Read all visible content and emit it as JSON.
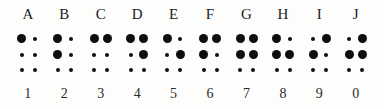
{
  "chart_data": {
    "type": "table",
    "xlabel": "",
    "ylabel": "",
    "legend": [],
    "grid": false,
    "cell_rows": 3,
    "cell_columns": 2,
    "dot_states": [
      "raised",
      "flat"
    ],
    "colors": {
      "background": "#fdfdfc",
      "dot": "#0d0d0d",
      "text": "#1b1b1b"
    },
    "columns": [
      {
        "letter": "A",
        "number": "1",
        "raised_dots": [
          1
        ],
        "pattern": [
          [
            "raised",
            "flat"
          ],
          [
            "flat",
            "flat"
          ],
          [
            "flat",
            "flat"
          ]
        ]
      },
      {
        "letter": "B",
        "number": "2",
        "raised_dots": [
          1,
          2
        ],
        "pattern": [
          [
            "raised",
            "flat"
          ],
          [
            "raised",
            "flat"
          ],
          [
            "flat",
            "flat"
          ]
        ]
      },
      {
        "letter": "C",
        "number": "3",
        "raised_dots": [
          1,
          4
        ],
        "pattern": [
          [
            "raised",
            "raised"
          ],
          [
            "flat",
            "flat"
          ],
          [
            "flat",
            "flat"
          ]
        ]
      },
      {
        "letter": "D",
        "number": "4",
        "raised_dots": [
          1,
          4,
          5
        ],
        "pattern": [
          [
            "raised",
            "raised"
          ],
          [
            "flat",
            "raised"
          ],
          [
            "flat",
            "flat"
          ]
        ]
      },
      {
        "letter": "E",
        "number": "5",
        "raised_dots": [
          1,
          5
        ],
        "pattern": [
          [
            "raised",
            "flat"
          ],
          [
            "flat",
            "raised"
          ],
          [
            "flat",
            "flat"
          ]
        ]
      },
      {
        "letter": "F",
        "number": "6",
        "raised_dots": [
          1,
          2,
          4
        ],
        "pattern": [
          [
            "raised",
            "raised"
          ],
          [
            "raised",
            "flat"
          ],
          [
            "flat",
            "flat"
          ]
        ]
      },
      {
        "letter": "G",
        "number": "7",
        "raised_dots": [
          1,
          2,
          4,
          5
        ],
        "pattern": [
          [
            "raised",
            "raised"
          ],
          [
            "raised",
            "raised"
          ],
          [
            "flat",
            "flat"
          ]
        ]
      },
      {
        "letter": "H",
        "number": "8",
        "raised_dots": [
          1,
          2,
          5
        ],
        "pattern": [
          [
            "raised",
            "flat"
          ],
          [
            "raised",
            "raised"
          ],
          [
            "flat",
            "flat"
          ]
        ]
      },
      {
        "letter": "I",
        "number": "9",
        "raised_dots": [
          2,
          4
        ],
        "pattern": [
          [
            "flat",
            "raised"
          ],
          [
            "raised",
            "flat"
          ],
          [
            "flat",
            "flat"
          ]
        ]
      },
      {
        "letter": "J",
        "number": "0",
        "raised_dots": [
          2,
          4,
          5
        ],
        "pattern": [
          [
            "flat",
            "raised"
          ],
          [
            "raised",
            "raised"
          ],
          [
            "flat",
            "flat"
          ]
        ]
      }
    ]
  }
}
